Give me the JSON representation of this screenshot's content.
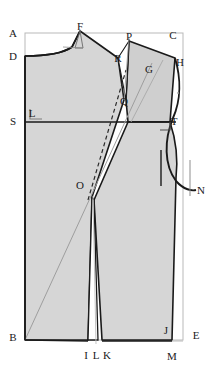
{
  "diagram": {
    "type": "garment-pattern-draft",
    "colors": {
      "paper": "#ffffff",
      "piece_fill": "#d6d6d6",
      "piece_fill_secondary": "#cfcfcf",
      "outline": "#1a1a1a",
      "construction_line": "#9a9a9a",
      "frame_line": "#b5b5b5",
      "label_text": "#1a1a1a"
    },
    "points": [
      {
        "id": "A",
        "label": "A",
        "x": 13,
        "y": 33,
        "role": "frame-top-left"
      },
      {
        "id": "F",
        "label": "F",
        "x": 80,
        "y": 26,
        "role": "shoulder-neck-high"
      },
      {
        "id": "P",
        "label": "P",
        "x": 129,
        "y": 36,
        "role": "dart-leg-top"
      },
      {
        "id": "C",
        "label": "C",
        "x": 173,
        "y": 35,
        "role": "frame-top-right"
      },
      {
        "id": "D",
        "label": "D",
        "x": 13,
        "y": 56,
        "role": "center-front-neck"
      },
      {
        "id": "R",
        "label": "R",
        "x": 118,
        "y": 58,
        "role": "dart-leg-top-left"
      },
      {
        "id": "G",
        "label": "G",
        "x": 149,
        "y": 69,
        "role": "shoulder-mid"
      },
      {
        "id": "H",
        "label": "H",
        "x": 180,
        "y": 62,
        "role": "shoulder-tip"
      },
      {
        "id": "Q",
        "label": "Q",
        "x": 124,
        "y": 101,
        "role": "dart-point-upper"
      },
      {
        "id": "L",
        "label": "L",
        "x": 32,
        "y": 113,
        "role": "square-mark"
      },
      {
        "id": "S",
        "label": "S",
        "x": 13,
        "y": 121,
        "role": "bust-line-left"
      },
      {
        "id": "T",
        "label": "T",
        "x": 174,
        "y": 121,
        "role": "bust-line-right"
      },
      {
        "id": "O",
        "label": "O",
        "x": 80,
        "y": 185,
        "role": "bust-point"
      },
      {
        "id": "N",
        "label": "N",
        "x": 201,
        "y": 190,
        "role": "side-seam-top"
      },
      {
        "id": "B",
        "label": "B",
        "x": 13,
        "y": 337,
        "role": "frame-bottom-left"
      },
      {
        "id": "I",
        "label": "I",
        "x": 86,
        "y": 355,
        "role": "waist-dart-left"
      },
      {
        "id": "L2",
        "label": "L",
        "x": 96,
        "y": 355,
        "role": "waist-center"
      },
      {
        "id": "K",
        "label": "K",
        "x": 107,
        "y": 355,
        "role": "waist-dart-right"
      },
      {
        "id": "J",
        "label": "J",
        "x": 166,
        "y": 330,
        "role": "hem-corner-inner"
      },
      {
        "id": "M",
        "label": "M",
        "x": 172,
        "y": 356,
        "role": "hem-corner"
      },
      {
        "id": "E",
        "label": "E",
        "x": 196,
        "y": 335,
        "role": "frame-bottom-right"
      }
    ],
    "lines": {
      "bust_line_label": "S-T",
      "frame_label": "A-C-E-B",
      "dart_upper_label": "R-P-Q",
      "dart_waist_label": "I-K-O",
      "armhole_label": "H-N"
    }
  }
}
